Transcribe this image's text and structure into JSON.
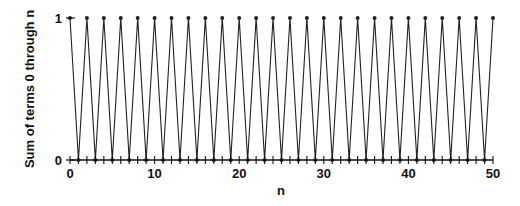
{
  "chart_data": {
    "type": "line",
    "title": "",
    "xlabel": "n",
    "ylabel": "Sum of terms 0 through n",
    "xlim": [
      0,
      50
    ],
    "ylim": [
      0,
      1
    ],
    "xticks": [
      0,
      10,
      20,
      30,
      40,
      50
    ],
    "yticks": [
      0,
      1
    ],
    "minor_xtick_step": 1,
    "grid": false,
    "legend": null,
    "markers": true,
    "series": [
      {
        "name": "partial sums",
        "x": [
          0,
          1,
          2,
          3,
          4,
          5,
          6,
          7,
          8,
          9,
          10,
          11,
          12,
          13,
          14,
          15,
          16,
          17,
          18,
          19,
          20,
          21,
          22,
          23,
          24,
          25,
          26,
          27,
          28,
          29,
          30,
          31,
          32,
          33,
          34,
          35,
          36,
          37,
          38,
          39,
          40,
          41,
          42,
          43,
          44,
          45,
          46,
          47,
          48,
          49,
          50
        ],
        "values": [
          1,
          0,
          1,
          0,
          1,
          0,
          1,
          0,
          1,
          0,
          1,
          0,
          1,
          0,
          1,
          0,
          1,
          0,
          1,
          0,
          1,
          0,
          1,
          0,
          1,
          0,
          1,
          0,
          1,
          0,
          1,
          0,
          1,
          0,
          1,
          0,
          1,
          0,
          1,
          0,
          1,
          0,
          1,
          0,
          1,
          0,
          1,
          0,
          1,
          0,
          1
        ]
      }
    ]
  },
  "colors": {
    "line": "#222222",
    "axis": "#111111"
  }
}
